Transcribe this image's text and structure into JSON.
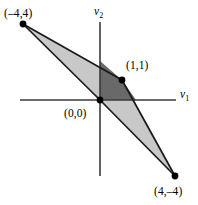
{
  "figure": {
    "background_color": "#ffffff",
    "axis_color": "#3a3a3a",
    "light_region_color": "#c8c8c8",
    "dark_region_color": "#696969",
    "outline_color": "#1a1a1a",
    "point_color": "#000000"
  },
  "axes": {
    "x_axis": {
      "label": "v",
      "subscript": "1",
      "name": "v1-axis",
      "pixel_y": 100,
      "pixel_x_start": 20,
      "pixel_x_end": 175
    },
    "y_axis": {
      "label": "v",
      "subscript": "2",
      "name": "v2-axis",
      "pixel_x": 100,
      "pixel_y_start": 22,
      "pixel_y_end": 176
    },
    "origin_pixel": [
      100,
      100
    ],
    "units_per_pixel": 0.0513,
    "pixels_per_unit": 19.5
  },
  "points": [
    {
      "id": "point-top-left",
      "label": "(–4,4)",
      "coords": [
        -4,
        4
      ],
      "pixel": [
        23,
        24
      ],
      "label_pixel": [
        4,
        8
      ]
    },
    {
      "id": "point-one-one",
      "label": "(1,1)",
      "coords": [
        1,
        1
      ],
      "pixel": [
        122,
        80
      ],
      "label_pixel": [
        126,
        60
      ]
    },
    {
      "id": "point-origin",
      "label": "(0,0)",
      "coords": [
        0,
        0
      ],
      "pixel": [
        100,
        100
      ],
      "label_pixel": [
        64,
        108
      ]
    },
    {
      "id": "point-bottom-right",
      "label": "(4,–4)",
      "coords": [
        4,
        -4
      ],
      "pixel": [
        175,
        176
      ],
      "label_pixel": [
        154,
        186
      ]
    }
  ],
  "regions": [
    {
      "id": "light-cone-region",
      "name": "light-shaded-cone",
      "fill": "#c8c8c8",
      "vertices_pixel": [
        [
          23,
          24
        ],
        [
          122,
          80
        ],
        [
          175,
          176
        ],
        [
          100,
          100
        ]
      ],
      "vertices_coords": [
        [
          -4,
          4
        ],
        [
          1,
          1
        ],
        [
          4,
          -4
        ],
        [
          0,
          0
        ]
      ]
    },
    {
      "id": "dark-parallelogram-region",
      "name": "dark-shaded-parallelogram",
      "fill": "#696969",
      "vertices_pixel": [
        [
          100,
          100
        ],
        [
          100,
          61
        ],
        [
          122,
          80
        ],
        [
          136,
          100
        ]
      ],
      "vertices_coords": [
        [
          0,
          0
        ],
        [
          0,
          2
        ],
        [
          1,
          1
        ],
        [
          1.85,
          0
        ]
      ]
    }
  ],
  "edges": [
    {
      "id": "edge-a-to-b",
      "from_pixel": [
        23,
        24
      ],
      "to_pixel": [
        122,
        80
      ]
    },
    {
      "id": "edge-b-to-c",
      "from_pixel": [
        122,
        80
      ],
      "to_pixel": [
        175,
        176
      ]
    },
    {
      "id": "edge-a-to-o",
      "from_pixel": [
        23,
        24
      ],
      "to_pixel": [
        100,
        100
      ]
    },
    {
      "id": "edge-o-to-c",
      "from_pixel": [
        100,
        100
      ],
      "to_pixel": [
        175,
        176
      ]
    }
  ]
}
